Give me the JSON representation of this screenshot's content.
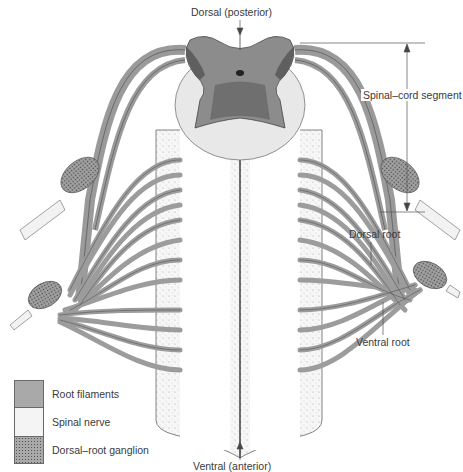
{
  "labels": {
    "dorsal_posterior": "Dorsal (posterior)",
    "ventral_anterior": "Ventral (anterior)",
    "spinal_cord_segment": "Spinal–cord segment",
    "dorsal_root": "Dorsal root",
    "ventral_root": "Ventral root"
  },
  "legend": {
    "items": [
      {
        "key": "root-filaments",
        "label": "Root filaments"
      },
      {
        "key": "spinal-nerve",
        "label": "Spinal nerve"
      },
      {
        "key": "dorsal-root-ganglion",
        "label": "Dorsal–root ganglion"
      }
    ]
  },
  "colors": {
    "root_filament_fill": "#a9a9a9",
    "grey_matter": "#8c8c8c",
    "white_matter": "#e8e8e8",
    "outline": "#555555",
    "nerve": "#f2f2f2"
  }
}
